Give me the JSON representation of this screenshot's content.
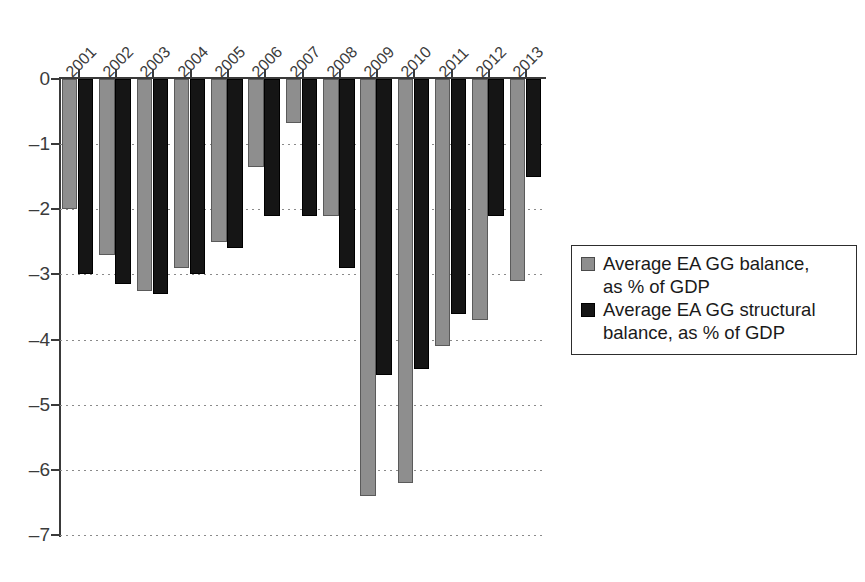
{
  "chart_data": {
    "type": "bar",
    "title": "",
    "subtitle": "",
    "xlabel": "",
    "ylabel": "",
    "grid": true,
    "legend_position": "right",
    "categories": [
      "2001",
      "2002",
      "2003",
      "2004",
      "2005",
      "2006",
      "2007",
      "2008",
      "2009",
      "2010",
      "2011",
      "2012",
      "2013"
    ],
    "ylim": [
      -7,
      0
    ],
    "yticks": [
      0,
      -1,
      -2,
      -3,
      -4,
      -5,
      -6,
      -7
    ],
    "ytick_labels": [
      "0",
      "–1",
      "–2",
      "–3",
      "–4",
      "–5",
      "–6",
      "–7"
    ],
    "series": [
      {
        "name": "Average EA GG balance, as % of GDP",
        "color": "#8e8e8e",
        "values": [
          -2.0,
          -2.7,
          -3.25,
          -2.9,
          -2.5,
          -1.35,
          -0.67,
          -2.1,
          -6.4,
          -6.2,
          -4.1,
          -3.7,
          -3.1
        ]
      },
      {
        "name": "Average EA GG structural balance, as % of GDP",
        "color": "#151515",
        "values": [
          -3.0,
          -3.15,
          -3.3,
          -3.0,
          -2.6,
          -2.1,
          -2.1,
          -2.9,
          -4.55,
          -4.45,
          -3.6,
          -2.1,
          -1.5
        ]
      }
    ]
  },
  "legend": {
    "entries": [
      {
        "swatch": "gray",
        "label": "Average EA GG balance,\nas % of GDP"
      },
      {
        "swatch": "black",
        "label": "Average EA GG structural\nbalance, as % of GDP"
      }
    ]
  }
}
